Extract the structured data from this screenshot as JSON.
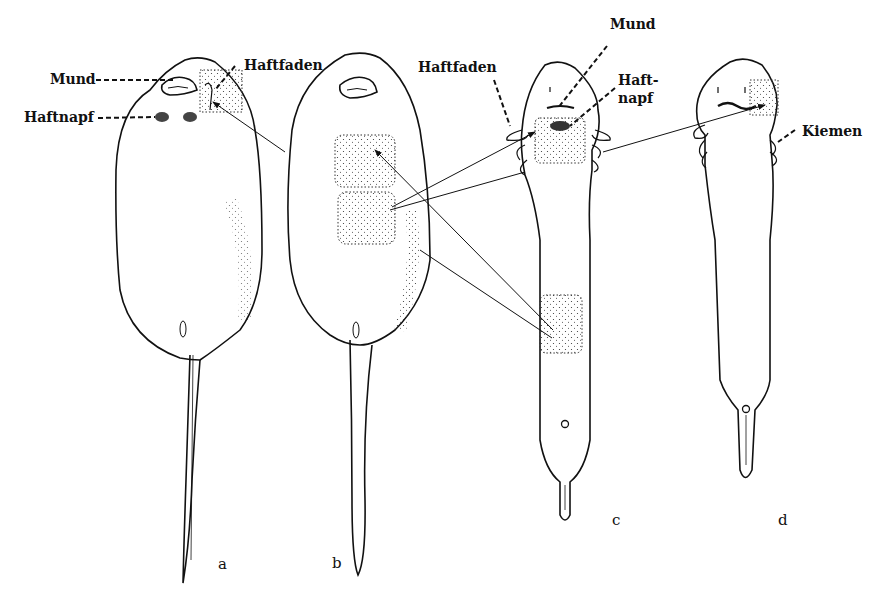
{
  "figure": {
    "stages": [
      {
        "id": "a",
        "label": "a"
      },
      {
        "id": "b",
        "label": "b"
      },
      {
        "id": "c",
        "label": "c"
      },
      {
        "id": "d",
        "label": "d"
      }
    ],
    "labels": {
      "mund_a": "Mund",
      "haftfaden_a": "Haftfaden",
      "haftnapf_a": "Haftnapf",
      "haftfaden_c": "Haftfaden",
      "mund_c": "Mund",
      "haftnapf_c_1": "Haft-",
      "haftnapf_c_2": "napf",
      "kiemen_d": "Kiemen"
    },
    "colors": {
      "ink": "#111111",
      "background": "#ffffff"
    }
  }
}
